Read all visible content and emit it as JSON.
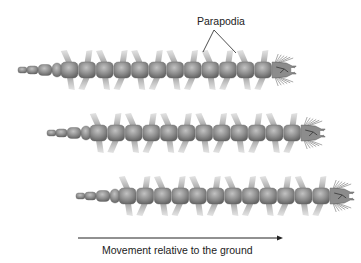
{
  "figure": {
    "callout_label": "Parapodia",
    "caption": "Movement relative to the ground",
    "colors": {
      "body": "#8a8a8a",
      "body_highlight": "#b4b4b4",
      "body_shadow": "#5e5e5e",
      "parapodia": "#9a9a9a",
      "line": "#222222"
    },
    "worms": [
      {
        "name": "worm-1",
        "tail_x": 18,
        "cy": 70,
        "segments": 12
      },
      {
        "name": "worm-2",
        "tail_x": 47,
        "cy": 133,
        "segments": 12
      },
      {
        "name": "worm-3",
        "tail_x": 76,
        "cy": 196,
        "segments": 12
      }
    ],
    "arrow": {
      "x1": 78,
      "x2": 283,
      "y": 238
    }
  }
}
